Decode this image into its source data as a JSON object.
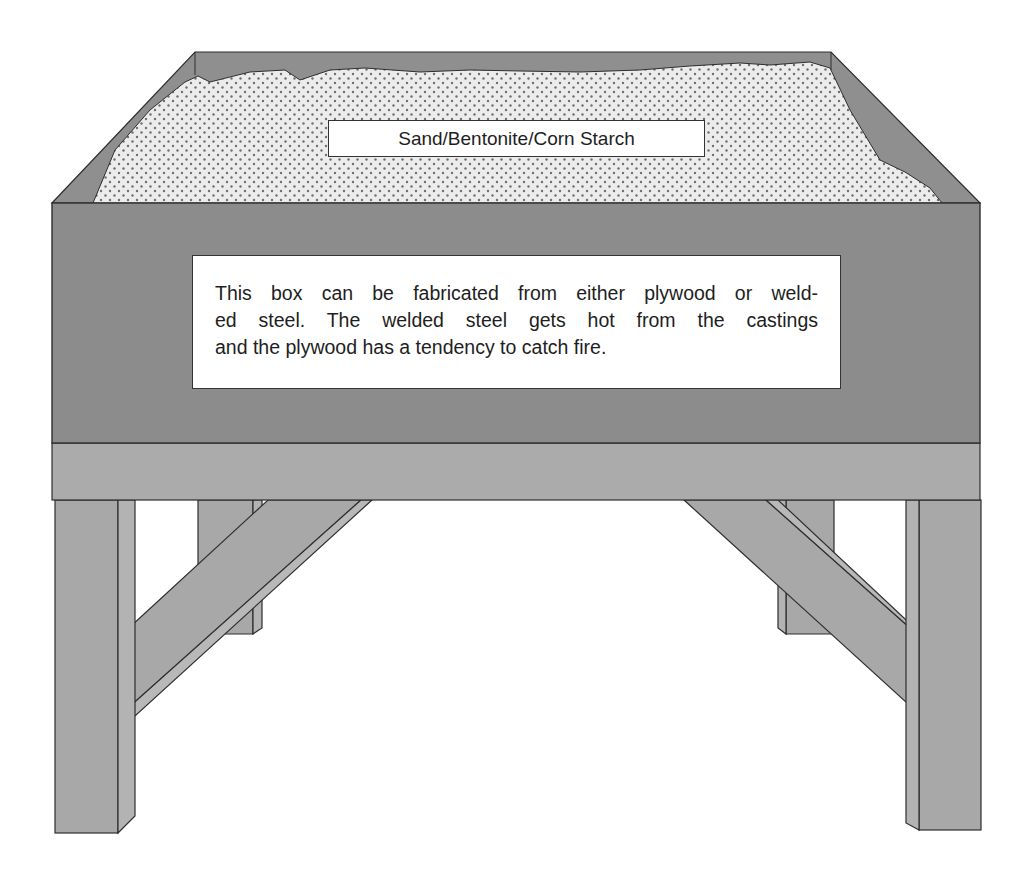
{
  "diagram": {
    "colors": {
      "box_face": "#8c8c8c",
      "rim": "#8f8f8f",
      "rail": "#ababab",
      "legs": "#a8a8a8",
      "leg_side": "#b3b3b3",
      "sand": "#ececec",
      "sand_dots": "#6f6f6f",
      "outline": "#2e2e2e"
    },
    "labels": {
      "sand_label": "Sand/Bentonite/Corn Starch",
      "note_lines": [
        "This box can be fabricated from either plywood or weld-",
        "ed steel. The welded steel gets hot from the castings",
        "and the plywood has a tendency to catch fire."
      ]
    }
  }
}
